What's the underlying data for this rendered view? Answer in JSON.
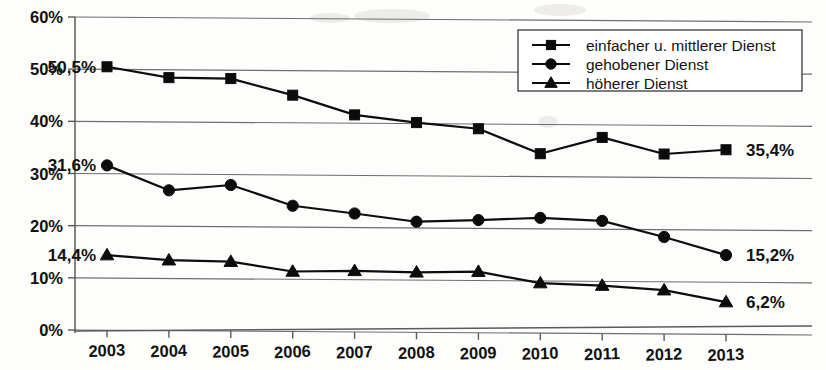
{
  "chart_data": {
    "type": "line",
    "title": "",
    "subtitle": "",
    "xlabel": "",
    "ylabel": "",
    "categories": [
      "2003",
      "2004",
      "2005",
      "2006",
      "2007",
      "2008",
      "2009",
      "2010",
      "2011",
      "2012",
      "2013"
    ],
    "ylim": [
      0,
      60
    ],
    "ytick_labels": [
      "0%",
      "10%",
      "20%",
      "30%",
      "40%",
      "50%",
      "60%"
    ],
    "ytick_values": [
      0,
      10,
      20,
      30,
      40,
      50,
      60
    ],
    "grid": "horizontal",
    "legend_position": "top-right",
    "value_format": "percent-comma",
    "series": [
      {
        "name": "einfacher u. mittlerer Dienst",
        "marker": "square",
        "color": "#0b0b0b",
        "values": [
          50.5,
          48.5,
          48.4,
          45.3,
          41.6,
          40.2,
          39.1,
          34.4,
          37.6,
          34.5,
          35.4
        ],
        "start_label": "50,5%",
        "end_label": "35,4%"
      },
      {
        "name": "gehobener Dienst",
        "marker": "circle",
        "color": "#0b0b0b",
        "values": [
          31.6,
          26.9,
          28.0,
          24.1,
          22.7,
          21.2,
          21.6,
          22.1,
          21.6,
          18.6,
          15.2
        ],
        "start_label": "31,6%",
        "end_label": "15,2%"
      },
      {
        "name": "höherer Dienst",
        "marker": "triangle",
        "color": "#0b0b0b",
        "values": [
          14.4,
          13.5,
          13.3,
          11.5,
          11.7,
          11.5,
          11.7,
          9.6,
          9.2,
          8.4,
          6.2
        ],
        "start_label": "14,4%",
        "end_label": "6,2%"
      }
    ]
  },
  "legend": {
    "entries": [
      {
        "label": "einfacher u. mittlerer Dienst",
        "marker": "square"
      },
      {
        "label": "gehobener Dienst",
        "marker": "circle"
      },
      {
        "label": "höherer Dienst",
        "marker": "triangle"
      }
    ]
  }
}
